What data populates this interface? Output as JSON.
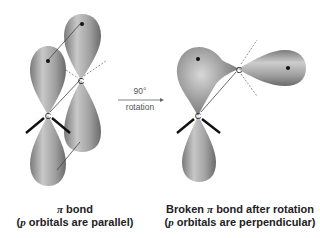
{
  "left_panel": {
    "title_symbol": "π",
    "title_rest": " bond",
    "subtitle_open": "(",
    "subtitle_p": "p",
    "subtitle_rest": " orbitals are parallel)",
    "atom_top": "C",
    "atom_bottom": "C"
  },
  "arrow": {
    "label_top": "90°",
    "label_bottom": "rotation"
  },
  "right_panel": {
    "title_prefix": "Broken ",
    "title_symbol": "π",
    "title_rest": " bond after rotation",
    "subtitle_open": "(",
    "subtitle_p": "p",
    "subtitle_rest": " orbitals are perpendicular)",
    "atom_top": "C",
    "atom_bottom": "C"
  },
  "colors": {
    "lobe_light": "#d4d4d4",
    "lobe_mid": "#9a9a9a",
    "lobe_dark": "#6a6a6a",
    "text": "#222222"
  }
}
